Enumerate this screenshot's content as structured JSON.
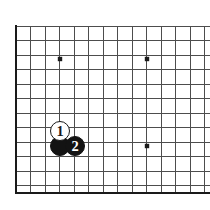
{
  "figure": {
    "background_color": "#ffffff",
    "board_color": "#ffffff",
    "line_color": "#4d4d4d",
    "border_color": "#1a1a1a",
    "star_color": "#1a1a1a"
  },
  "board": {
    "left_edge_x": 16,
    "top_line_y": 26,
    "bottom_edge_y": 193,
    "right_clip_x": 210,
    "spacing": 14.5,
    "vertical_line_count": 14,
    "horizontal_line_count": 12,
    "thick_edges": [
      "left",
      "bottom"
    ],
    "star_points": [
      {
        "name": "star-point-top-left",
        "x": 60,
        "y": 59
      },
      {
        "name": "star-point-top-right",
        "x": 147,
        "y": 59
      },
      {
        "name": "star-point-center-right",
        "x": 147,
        "y": 146
      }
    ]
  },
  "stones": [
    {
      "id": "stone-white-1",
      "color": "white",
      "label": "1",
      "move_number": 1,
      "x": 60,
      "y": 131,
      "radius": 10
    },
    {
      "id": "stone-black-unlabeled",
      "color": "black",
      "label": "",
      "move_number": null,
      "x": 60,
      "y": 146,
      "radius": 10
    },
    {
      "id": "stone-black-2",
      "color": "black",
      "label": "2",
      "move_number": 2,
      "x": 75,
      "y": 146,
      "radius": 10
    }
  ]
}
